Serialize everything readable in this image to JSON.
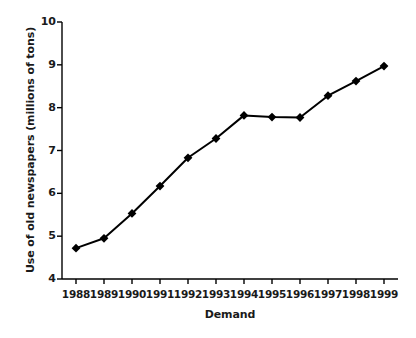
{
  "chart_data": {
    "type": "line",
    "title": "",
    "xlabel": "Demand",
    "ylabel": "Use of old newspapers (millions of tons)",
    "categories": [
      "1988",
      "1989",
      "1990",
      "1991",
      "1992",
      "1993",
      "1994",
      "1995",
      "1996",
      "1997",
      "1998",
      "1999"
    ],
    "x": [
      1988,
      1989,
      1990,
      1991,
      1992,
      1993,
      1994,
      1995,
      1996,
      1997,
      1998,
      1999
    ],
    "values": [
      4.72,
      4.95,
      5.53,
      6.17,
      6.83,
      7.28,
      7.82,
      7.78,
      7.77,
      8.28,
      8.62,
      8.97
    ],
    "series": [
      {
        "name": "Use of old newspapers",
        "values": [
          4.72,
          4.95,
          5.53,
          6.17,
          6.83,
          7.28,
          7.82,
          7.78,
          7.77,
          8.28,
          8.62,
          8.97
        ]
      }
    ],
    "ylim": [
      4,
      10
    ],
    "yticks": [
      4,
      5,
      6,
      7,
      8,
      9,
      10
    ],
    "ytick_labels": [
      "4",
      "5",
      "6",
      "7",
      "8",
      "9",
      "10"
    ],
    "xtick_labels": [
      "1988",
      "1989",
      "1990",
      "1991",
      "1992",
      "1993",
      "1994",
      "1995",
      "1996",
      "1997",
      "1998",
      "1999"
    ],
    "grid": false,
    "legend": false,
    "legend_position": "none",
    "marker": "diamond",
    "line_color": "#000000",
    "marker_color": "#000000",
    "axis_color": "#000000",
    "background_color": "#ffffff",
    "text_color": "#1a1a1a"
  }
}
